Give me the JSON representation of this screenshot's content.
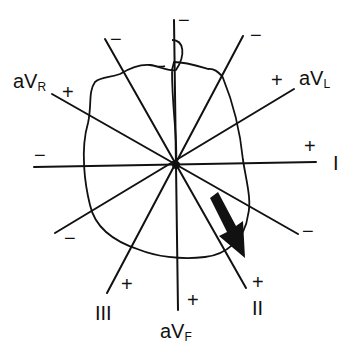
{
  "figure": {
    "center": [
      176,
      165
    ],
    "colors": {
      "ink": "#111111",
      "background": "#ffffff"
    },
    "leads": [
      {
        "id": "I",
        "name": "I",
        "sub": "",
        "positive_sign": "+",
        "negative_sign": "−"
      },
      {
        "id": "II",
        "name": "II",
        "sub": "",
        "positive_sign": "+",
        "negative_sign": "−"
      },
      {
        "id": "III",
        "name": "III",
        "sub": "",
        "positive_sign": "+",
        "negative_sign": "−"
      },
      {
        "id": "aVR",
        "name": "aV",
        "sub": "R",
        "positive_sign": "+",
        "negative_sign": "−"
      },
      {
        "id": "aVL",
        "name": "aV",
        "sub": "L",
        "positive_sign": "+",
        "negative_sign": "−"
      },
      {
        "id": "aVF",
        "name": "aV",
        "sub": "F",
        "positive_sign": "+",
        "negative_sign": "−"
      }
    ],
    "mean_vector": {
      "icon": "arrow-icon",
      "direction": "toward lead II positive pole"
    }
  }
}
